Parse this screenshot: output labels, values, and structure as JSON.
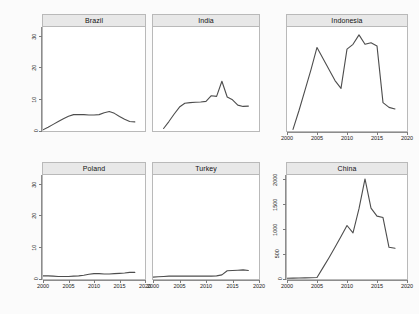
{
  "chart_data": {
    "type": "line",
    "title": "",
    "xlabel": "",
    "ylabel": "",
    "grid": false,
    "legend": null,
    "layout": {
      "rows": 2,
      "cols": 3,
      "shared_x": true,
      "shared_y_by_row": true
    },
    "xlim": [
      2000,
      2020
    ],
    "xticks": [
      2000,
      2005,
      2010,
      2015,
      2020
    ],
    "xtick_labels": [
      "2000",
      "2005",
      "2010",
      "2015",
      "2020"
    ],
    "panels": [
      {
        "name": "Brazil",
        "row": 0,
        "col": 0,
        "ylim": [
          0,
          33
        ],
        "yticks": [
          0,
          10,
          20,
          30
        ],
        "ytick_labels": [
          "0",
          "10",
          "20",
          "30"
        ],
        "x": [
          2000,
          2001,
          2002,
          2003,
          2004,
          2005,
          2006,
          2007,
          2008,
          2009,
          2010,
          2011,
          2012,
          2013,
          2014,
          2015,
          2016,
          2017,
          2018
        ],
        "values": [
          0.4,
          1.2,
          2.1,
          3.0,
          3.9,
          4.7,
          5.2,
          5.2,
          5.2,
          5.1,
          5.1,
          5.2,
          5.8,
          6.2,
          5.6,
          4.6,
          3.7,
          3.0,
          2.9
        ]
      },
      {
        "name": "India",
        "row": 0,
        "col": 1,
        "ylim": [
          0,
          33
        ],
        "yticks": [
          0,
          10,
          20,
          30
        ],
        "ytick_labels": [
          "0",
          "10",
          "20",
          "30"
        ],
        "x": [
          2002,
          2003,
          2004,
          2005,
          2006,
          2007,
          2008,
          2009,
          2010,
          2011,
          2012,
          2013,
          2014,
          2015,
          2016,
          2017,
          2018
        ],
        "values": [
          0.8,
          3.0,
          5.4,
          7.6,
          8.8,
          9.0,
          9.1,
          9.2,
          9.4,
          11.2,
          11.0,
          15.8,
          10.8,
          9.9,
          8.2,
          7.8,
          7.9
        ]
      },
      {
        "name": "Indonesia",
        "row": 0,
        "col": 2,
        "ylim": [
          0,
          33
        ],
        "yticks": [
          0,
          10,
          20,
          30
        ],
        "ytick_labels": [
          "0",
          "10",
          "20",
          "30"
        ],
        "x": [
          2001,
          2002,
          2003,
          2004,
          2005,
          2006,
          2007,
          2008,
          2009,
          2010,
          2011,
          2012,
          2013,
          2014,
          2015,
          2016,
          2017,
          2018
        ],
        "values": [
          0.5,
          6.5,
          13.0,
          19.5,
          26.5,
          23.0,
          19.5,
          16.0,
          13.5,
          26.0,
          27.5,
          30.5,
          27.5,
          28.0,
          27.0,
          9.0,
          7.5,
          7.0
        ]
      },
      {
        "name": "Poland",
        "row": 1,
        "col": 0,
        "ylim": [
          0,
          33
        ],
        "yticks": [
          0,
          10,
          20,
          30
        ],
        "ytick_labels": [
          "0",
          "10",
          "20",
          "30"
        ],
        "x": [
          2000,
          2001,
          2002,
          2003,
          2004,
          2005,
          2006,
          2007,
          2008,
          2009,
          2010,
          2011,
          2012,
          2013,
          2014,
          2015,
          2016,
          2017,
          2018
        ],
        "values": [
          1.0,
          1.0,
          0.9,
          0.8,
          0.8,
          0.8,
          0.9,
          1.0,
          1.2,
          1.5,
          1.7,
          1.7,
          1.6,
          1.6,
          1.7,
          1.8,
          1.9,
          2.1,
          2.1
        ]
      },
      {
        "name": "Turkey",
        "row": 1,
        "col": 1,
        "ylim": [
          0,
          33
        ],
        "yticks": [
          0,
          10,
          20,
          30
        ],
        "ytick_labels": [
          "0",
          "10",
          "20",
          "30"
        ],
        "x": [
          2000,
          2001,
          2002,
          2003,
          2004,
          2005,
          2006,
          2007,
          2008,
          2009,
          2010,
          2011,
          2012,
          2013,
          2014,
          2015,
          2016,
          2017,
          2018
        ],
        "values": [
          0.6,
          0.7,
          0.8,
          0.9,
          0.9,
          0.9,
          0.9,
          0.9,
          0.9,
          0.9,
          0.9,
          0.9,
          1.0,
          1.3,
          2.6,
          2.7,
          2.8,
          2.9,
          2.7
        ]
      },
      {
        "name": "China",
        "row": 1,
        "col": 2,
        "ylim": [
          0,
          2100
        ],
        "yticks": [
          0,
          500,
          1000,
          1500,
          2000
        ],
        "ytick_labels": [
          "0",
          "500",
          "1000",
          "1500",
          "2000"
        ],
        "x": [
          2000,
          2001,
          2002,
          2003,
          2004,
          2005,
          2006,
          2007,
          2008,
          2009,
          2010,
          2011,
          2012,
          2013,
          2014,
          2015,
          2016,
          2017,
          2018
        ],
        "values": [
          15,
          18,
          20,
          22,
          25,
          30,
          230,
          430,
          640,
          860,
          1080,
          930,
          1420,
          2020,
          1430,
          1270,
          1240,
          640,
          620,
          460
        ]
      }
    ]
  }
}
